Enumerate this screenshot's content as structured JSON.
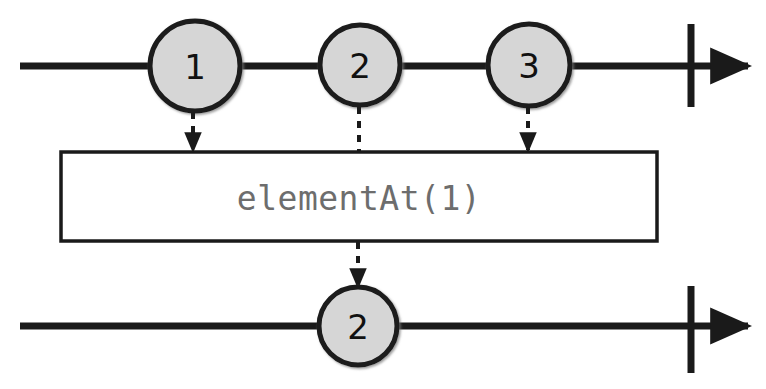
{
  "diagram": {
    "type": "rxjs-marble-diagram",
    "operator_label": "elementAt(1)",
    "source_stream": {
      "name": "source-timeline",
      "marbles": [
        {
          "label": "1",
          "cx": 195,
          "cy": 66,
          "r": 45
        },
        {
          "label": "2",
          "cx": 360,
          "cy": 65,
          "r": 40
        },
        {
          "label": "3",
          "cx": 529,
          "cy": 65,
          "r": 41
        }
      ],
      "line_y": 66,
      "line_start_x": 20,
      "line_end_x": 756,
      "completion_bar_x": 691,
      "completion_bar_top": 24,
      "completion_bar_bottom": 107
    },
    "result_stream": {
      "name": "result-timeline",
      "marbles": [
        {
          "label": "2",
          "cx": 358,
          "cy": 326,
          "r": 39
        }
      ],
      "line_y": 326,
      "line_start_x": 20,
      "line_end_x": 756,
      "completion_bar_x": 691,
      "completion_bar_top": 286,
      "completion_bar_bottom": 373
    },
    "operator_box": {
      "x": 61,
      "y": 152,
      "width": 596,
      "height": 89
    },
    "connectors": [
      {
        "name": "connector-marble-1",
        "x": 193,
        "from_y": 112,
        "to_y": 151,
        "arrowhead": true
      },
      {
        "name": "connector-marble-2",
        "x": 359,
        "from_y": 107,
        "to_y": 152,
        "arrowhead": false
      },
      {
        "name": "connector-marble-3",
        "x": 528,
        "from_y": 107,
        "to_y": 151,
        "arrowhead": true
      },
      {
        "name": "connector-output",
        "x": 358,
        "from_y": 242,
        "to_y": 287,
        "arrowhead": true
      }
    ],
    "colors": {
      "stroke": "#1a1a1a",
      "marble_fill": "#d6d6d6",
      "operator_text": "#6d6d6d",
      "marble_text": "#111111",
      "background": "#ffffff"
    }
  }
}
